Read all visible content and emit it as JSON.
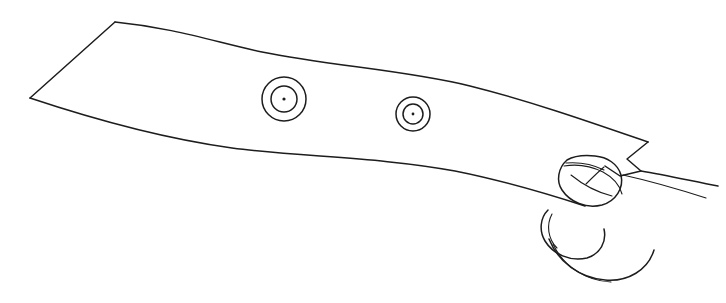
{
  "image": {
    "title": "Hand-drawn line sketch of a curved band with eyelets and hooks",
    "medium": "ink line drawing",
    "background_color": "#ffffff",
    "ink_color": "#1d1d1f",
    "width": 726,
    "height": 303
  },
  "drawing": {
    "subject": "curved strap or band tapering left to right with two concentric ring eyelets and a pair of curled hook forms at the right end",
    "style": "single-weight contour outline, no shading, no fill",
    "parts": [
      {
        "name": "band-outline",
        "label": "Curved tapering band",
        "description": "Long quadrilateral band sweeping from upper-left down to the right, bounded by a gently S-curved top edge and a concave bottom edge"
      },
      {
        "name": "eyelet-left",
        "label": "Left eyelet",
        "description": "Concentric circles with a small centre dot",
        "center_x": 284,
        "center_y": 99,
        "radii": [
          22,
          13,
          2
        ],
        "dot_radius": 1.6
      },
      {
        "name": "eyelet-right",
        "label": "Right eyelet",
        "description": "Smaller concentric circles with a small centre dot",
        "center_x": 413,
        "center_y": 114,
        "radii": [
          17,
          10,
          1.8
        ],
        "dot_radius": 1.4
      },
      {
        "name": "hook-upper",
        "label": "Upper curled hook",
        "description": "Rounded fingernail-like dome folded over the band edge near the right end"
      },
      {
        "name": "hook-lower",
        "label": "Lower curled hook",
        "description": "Second rounded hook curling below and to the left of the upper hook"
      },
      {
        "name": "band-tip",
        "label": "Band tip notch",
        "description": "Angular notched corner where the band terminates on the right"
      },
      {
        "name": "tail-lines",
        "label": "Tail strokes",
        "description": "Two thin tapering strokes extending to the right edge from the notch"
      }
    ],
    "counts": {
      "eyelets": 2,
      "hooks": 2,
      "tail_strokes": 2
    }
  },
  "geometry": {
    "band_top_edge": "M 115 22 C 175 28 215 42 262 52 C 330 66 405 70 470 86 C 530 101 590 122 648 142",
    "band_bottom_edge": "M 30 98 C 90 118 160 138 232 148 C 300 157 380 157 455 171 C 505 181 545 193 585 206",
    "band_left_edge": "M 115 22 L 30 98",
    "band_tip_notch": "M 648 142 L 627 159 L 641 171 L 620 176 L 605 166",
    "tail_upper": "M 641 171 C 665 175 692 181 718 186",
    "tail_lower": "M 623 175 C 650 181 678 189 706 198",
    "hook_upper_outer": "M 567 160 C 558 168 556 181 562 190 C 570 202 586 209 602 205 C 616 201 624 188 621 175 C 618 164 607 157 595 156 C 585 155 574 156 567 160 Z",
    "hook_upper_inner": "M 571 175 C 582 184 596 192 612 196",
    "hook_upper_ridge": "M 566 163 C 578 162 592 164 604 170",
    "hook_lower_outer": "M 548 210 C 540 218 539 231 545 241 C 553 254 570 262 587 258 C 600 254 607 242 604 229",
    "hook_lower_inner": "M 552 214 C 546 225 548 239 557 248",
    "hook_lower_sweep": "M 549 239 C 558 262 580 278 605 280 C 628 282 648 270 654 250",
    "hook_lower_edge": "M 553 244 C 563 266 586 281 611 282"
  }
}
